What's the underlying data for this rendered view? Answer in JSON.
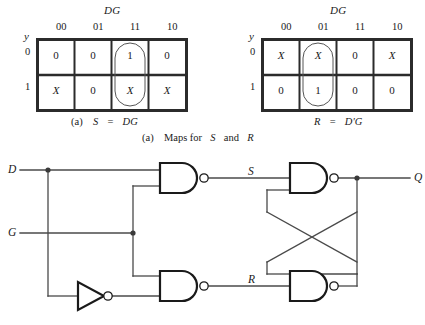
{
  "figure": {
    "caption": "(a)  Maps for S and R",
    "caption_parts": {
      "prefix": "(a)",
      "text": "Maps for",
      "var1": "S",
      "conj": "and",
      "var2": "R"
    }
  },
  "kmaps": [
    {
      "id": "map-s",
      "top_label": "DG",
      "row_var": "y",
      "col_headers": [
        "00",
        "01",
        "11",
        "10"
      ],
      "row_headers": [
        "0",
        "1"
      ],
      "cells": [
        [
          "0",
          "0",
          "1",
          "0"
        ],
        [
          "X",
          "0",
          "X",
          "X"
        ]
      ],
      "group_column": 2,
      "caption_prefix": "(a)",
      "caption_lhs": "S",
      "caption_eq": "=",
      "caption_rhs": "DG"
    },
    {
      "id": "map-r",
      "top_label": "DG",
      "row_var": "y",
      "col_headers": [
        "00",
        "01",
        "11",
        "10"
      ],
      "row_headers": [
        "0",
        "1"
      ],
      "cells": [
        [
          "X",
          "X",
          "0",
          "X"
        ],
        [
          "0",
          "1",
          "0",
          "0"
        ]
      ],
      "group_column": 1,
      "caption_prefix": "",
      "caption_lhs": "R",
      "caption_eq": "=",
      "caption_rhs": "D'G"
    }
  ],
  "circuit": {
    "inputs": [
      {
        "name": "D",
        "label": "D"
      },
      {
        "name": "G",
        "label": "G"
      }
    ],
    "internal_signals": [
      {
        "name": "S",
        "label": "S"
      },
      {
        "name": "R",
        "label": "R"
      }
    ],
    "outputs": [
      {
        "name": "Q",
        "label": "Q"
      }
    ],
    "gates": [
      {
        "name": "nand-s",
        "type": "NAND",
        "inputs": [
          "D",
          "G"
        ],
        "output": "S"
      },
      {
        "name": "nand-r",
        "type": "NAND",
        "inputs": [
          "G",
          "Dnot"
        ],
        "output": "R"
      },
      {
        "name": "inverter-d",
        "type": "NOT",
        "inputs": [
          "D"
        ],
        "output": "Dnot"
      },
      {
        "name": "nand-q",
        "type": "NAND",
        "inputs": [
          "S",
          "Qnot"
        ],
        "output": "Q"
      },
      {
        "name": "nand-qnot",
        "type": "NAND",
        "inputs": [
          "Q",
          "R"
        ],
        "output": "Qnot"
      }
    ]
  },
  "colors": {
    "ink": "#1a1a1a",
    "wire": "#4a4a4a",
    "grid": "#2b2b2b",
    "background": "#ffffff"
  }
}
